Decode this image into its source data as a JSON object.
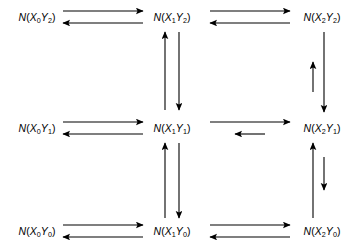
{
  "diagram": {
    "type": "state-transition-grid",
    "width": 355,
    "height": 246,
    "background_color": "#ffffff",
    "stroke_color": "#000000",
    "nodes": [
      {
        "id": "n-x0y2",
        "label_html": "N(X<sub>0</sub>Y<sub>2</sub>)",
        "n": "N",
        "x_index": 0,
        "y_index": 2,
        "cx": 37,
        "cy": 17
      },
      {
        "id": "n-x1y2",
        "label_html": "N(X<sub>1</sub>Y<sub>2</sub>)",
        "n": "N",
        "x_index": 1,
        "y_index": 2,
        "cx": 172,
        "cy": 17
      },
      {
        "id": "n-x2y2",
        "label_html": "N(X<sub>2</sub>Y<sub>2</sub>)",
        "n": "N",
        "x_index": 2,
        "y_index": 2,
        "cx": 322,
        "cy": 17
      },
      {
        "id": "n-x0y1",
        "label_html": "N(X<sub>0</sub>Y<sub>1</sub>)",
        "n": "N",
        "x_index": 0,
        "y_index": 1,
        "cx": 37,
        "cy": 128
      },
      {
        "id": "n-x1y1",
        "label_html": "N(X<sub>1</sub>Y<sub>1</sub>)",
        "n": "N",
        "x_index": 1,
        "y_index": 1,
        "cx": 172,
        "cy": 128
      },
      {
        "id": "n-x2y1",
        "label_html": "N(X<sub>2</sub>Y<sub>1</sub>)",
        "n": "N",
        "x_index": 2,
        "y_index": 1,
        "cx": 322,
        "cy": 128
      },
      {
        "id": "n-x0y0",
        "label_html": "N(X<sub>0</sub>Y<sub>0</sub>)",
        "n": "N",
        "x_index": 0,
        "y_index": 0,
        "cx": 37,
        "cy": 231
      },
      {
        "id": "n-x1y0",
        "label_html": "N(X<sub>1</sub>Y<sub>0</sub>)",
        "n": "N",
        "x_index": 1,
        "y_index": 0,
        "cx": 172,
        "cy": 231
      },
      {
        "id": "n-x2y0",
        "label_html": "N(X<sub>2</sub>Y<sub>0</sub>)",
        "n": "N",
        "x_index": 2,
        "y_index": 0,
        "cx": 322,
        "cy": 231
      }
    ],
    "arrows": [
      {
        "id": "a-top-left-forward",
        "direction": "right",
        "length": "long",
        "x1": 63,
        "y1": 11,
        "x2": 143,
        "y2": 11,
        "width": 1.1
      },
      {
        "id": "a-top-left-reverse",
        "direction": "left",
        "length": "long",
        "x1": 143,
        "y1": 23,
        "x2": 63,
        "y2": 23,
        "width": 1.1
      },
      {
        "id": "a-top-right-forward",
        "direction": "right",
        "length": "long",
        "x1": 210,
        "y1": 11,
        "x2": 290,
        "y2": 11,
        "width": 1.1
      },
      {
        "id": "a-top-right-reverse",
        "direction": "left",
        "length": "long",
        "x1": 290,
        "y1": 23,
        "x2": 210,
        "y2": 23,
        "width": 1.1
      },
      {
        "id": "a-mid-left-forward",
        "direction": "right",
        "length": "long",
        "x1": 63,
        "y1": 122,
        "x2": 143,
        "y2": 122,
        "width": 1.1
      },
      {
        "id": "a-mid-left-reverse",
        "direction": "left",
        "length": "long",
        "x1": 143,
        "y1": 134,
        "x2": 63,
        "y2": 134,
        "width": 1.1
      },
      {
        "id": "a-mid-right-forward",
        "direction": "right",
        "length": "long",
        "x1": 210,
        "y1": 122,
        "x2": 290,
        "y2": 122,
        "width": 1.1
      },
      {
        "id": "a-mid-right-reverse",
        "direction": "left",
        "length": "short",
        "x1": 265,
        "y1": 134,
        "x2": 235,
        "y2": 134,
        "width": 1.1
      },
      {
        "id": "a-bot-left-forward",
        "direction": "right",
        "length": "long",
        "x1": 63,
        "y1": 225,
        "x2": 143,
        "y2": 225,
        "width": 1.1
      },
      {
        "id": "a-bot-left-reverse",
        "direction": "left",
        "length": "long",
        "x1": 143,
        "y1": 237,
        "x2": 63,
        "y2": 237,
        "width": 1.1
      },
      {
        "id": "a-bot-right-forward",
        "direction": "right",
        "length": "long",
        "x1": 210,
        "y1": 225,
        "x2": 290,
        "y2": 225,
        "width": 1.1
      },
      {
        "id": "a-bot-right-reverse",
        "direction": "left",
        "length": "long",
        "x1": 290,
        "y1": 237,
        "x2": 210,
        "y2": 237,
        "width": 1.1
      },
      {
        "id": "a-midcol-upper-up",
        "direction": "up",
        "length": "long",
        "x1": 165,
        "y1": 110,
        "x2": 165,
        "y2": 32,
        "width": 1.1
      },
      {
        "id": "a-midcol-upper-down",
        "direction": "down",
        "length": "long",
        "x1": 179,
        "y1": 32,
        "x2": 179,
        "y2": 110,
        "width": 1.1
      },
      {
        "id": "a-midcol-lower-up",
        "direction": "up",
        "length": "long",
        "x1": 165,
        "y1": 218,
        "x2": 165,
        "y2": 143,
        "width": 1.1
      },
      {
        "id": "a-midcol-lower-down",
        "direction": "down",
        "length": "long",
        "x1": 179,
        "y1": 143,
        "x2": 179,
        "y2": 218,
        "width": 1.1
      },
      {
        "id": "a-rightcol-upper-up",
        "direction": "up",
        "length": "short",
        "x1": 313,
        "y1": 92,
        "x2": 313,
        "y2": 62,
        "width": 1.1
      },
      {
        "id": "a-rightcol-upper-down",
        "direction": "down",
        "length": "long",
        "x1": 324,
        "y1": 32,
        "x2": 324,
        "y2": 112,
        "width": 1.1
      },
      {
        "id": "a-rightcol-lower-up",
        "direction": "up",
        "length": "long",
        "x1": 313,
        "y1": 218,
        "x2": 313,
        "y2": 143,
        "width": 1.1
      },
      {
        "id": "a-rightcol-lower-down",
        "direction": "down",
        "length": "short",
        "x1": 324,
        "y1": 157,
        "x2": 324,
        "y2": 190,
        "width": 1.1
      }
    ]
  }
}
